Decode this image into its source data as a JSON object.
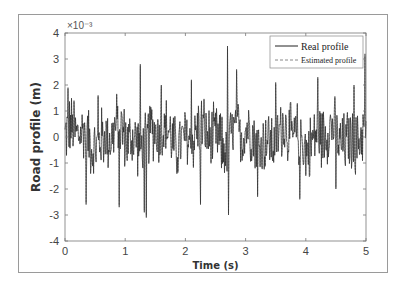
{
  "chart_data": {
    "type": "line",
    "title": "",
    "xlabel": "Time (s)",
    "ylabel": "Road profile (m)",
    "y_multiplier": "×10⁻³",
    "xlim": [
      0,
      5
    ],
    "ylim": [
      -4,
      4
    ],
    "x_ticks": [
      0,
      1,
      2,
      3,
      4,
      5
    ],
    "y_ticks": [
      -4,
      -3,
      -2,
      -1,
      0,
      1,
      2,
      3,
      4
    ],
    "grid": false,
    "legend_position": "upper right",
    "series": [
      {
        "name": "Real profile",
        "style": "solid",
        "color": "#222222"
      },
      {
        "name": "Estimated profile",
        "style": "dashed",
        "color": "#888888"
      }
    ],
    "notable_points": {
      "x": [
        0.05,
        0.15,
        0.35,
        0.55,
        0.9,
        1.25,
        1.32,
        1.35,
        1.6,
        2.1,
        2.25,
        2.7,
        2.72,
        2.85,
        3.2,
        3.5,
        3.9,
        4.2,
        4.5,
        4.8,
        4.98
      ],
      "y": [
        1.9,
        1.4,
        -2.6,
        1.6,
        -2.7,
        2.8,
        -2.9,
        -3.1,
        2.0,
        2.2,
        -2.6,
        3.5,
        -3.0,
        2.6,
        -2.3,
        2.1,
        -2.4,
        2.3,
        -2.0,
        2.0,
        3.2
      ]
    },
    "sample_rate_points": 600,
    "typical_amplitude": 1.2
  }
}
